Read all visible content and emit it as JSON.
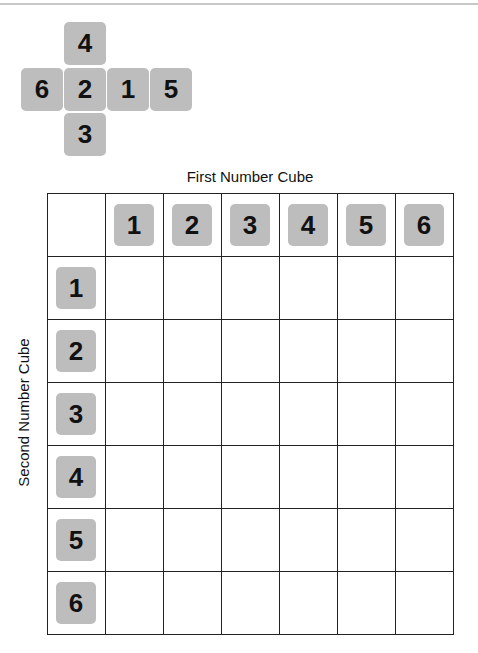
{
  "cube_net": {
    "top": "4",
    "left": "6",
    "center": "2",
    "right1": "1",
    "right2": "5",
    "bottom": "3"
  },
  "table": {
    "x_axis_title": "First Number Cube",
    "y_axis_title": "Second Number Cube",
    "column_headers": [
      "1",
      "2",
      "3",
      "4",
      "5",
      "6"
    ],
    "row_headers": [
      "1",
      "2",
      "3",
      "4",
      "5",
      "6"
    ]
  },
  "colors": {
    "tile": "#bdbdbd",
    "grid_line": "#222222"
  }
}
